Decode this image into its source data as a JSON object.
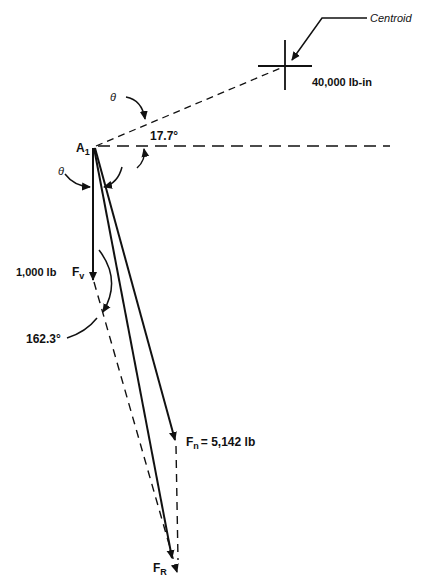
{
  "diagram": {
    "labels": {
      "centroid": "Centroid",
      "moment": "40,000 lb-in",
      "theta_top": "θ",
      "theta_left": "θ",
      "angle_small": "17.7°",
      "point_main": "A",
      "point_sub": "1",
      "fv_value": "1,000 lb",
      "fv_main": "F",
      "fv_sub": "v",
      "angle_large": "162.3°",
      "fn_main": "F",
      "fn_sub": "n",
      "fn_value": "= 5,142 lb",
      "fr_main": "F",
      "fr_sub": "R"
    },
    "colors": {
      "ink": "#111111",
      "background": "#ffffff"
    }
  }
}
